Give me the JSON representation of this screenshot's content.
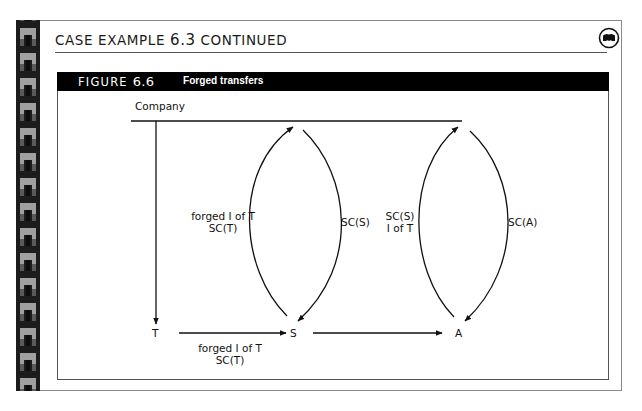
{
  "header": {
    "case_title_prefix": "CASE EXAMPLE ",
    "case_number": "6.3",
    "case_title_suffix": " CONTINUED",
    "icon": "case-example-badge-icon"
  },
  "figure": {
    "label_prefix": "FIGURE ",
    "number": "6.6",
    "caption": "Forged transfers"
  },
  "diagram": {
    "nodes": {
      "company": "Company",
      "t": "T",
      "s": "S",
      "a": "A"
    },
    "edges": [
      {
        "from": "T",
        "to": "Company",
        "label_line1": "forged I of T",
        "label_line2": "SC(T)"
      },
      {
        "from": "Company",
        "to": "S",
        "label_line1": "SC(S)",
        "label_line2": ""
      },
      {
        "from": "S",
        "to": "Company",
        "label_line1": "SC(S)",
        "label_line2": "I of T"
      },
      {
        "from": "Company",
        "to": "A",
        "label_line1": "SC(A)",
        "label_line2": ""
      },
      {
        "from": "T",
        "to": "S",
        "label_line1": "forged I of T",
        "label_line2": "SC(T)"
      },
      {
        "from": "S",
        "to": "A",
        "label_line1": "",
        "label_line2": ""
      },
      {
        "from": "Company",
        "to": "T",
        "label_line1": "",
        "label_line2": ""
      }
    ]
  },
  "colors": {
    "strip_dark": "#1c1c1c",
    "strip_tile": "#9a9a9a",
    "header_bg": "#000000",
    "header_text": "#ffffff",
    "line": "#111111"
  }
}
